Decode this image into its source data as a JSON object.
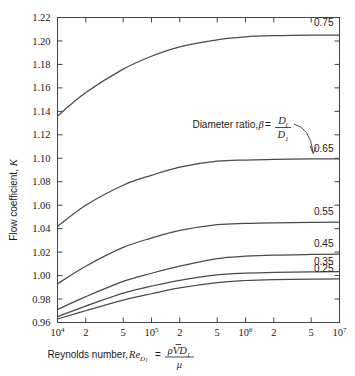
{
  "chart_data": {
    "type": "line",
    "title": "",
    "xlabel": "Reynolds number, Re_D1 = rho V D1 / mu",
    "ylabel": "Flow coefficient, K",
    "xscale": "log",
    "xlim": [
      10000,
      10000000
    ],
    "ylim": [
      0.96,
      1.22
    ],
    "grid": false,
    "legend_position": "inline-right-end-labels",
    "xtick_labels": [
      "10",
      "2",
      "5",
      "10",
      "2",
      "5",
      "10",
      "2",
      "5",
      "10"
    ],
    "xtick_exponents": [
      "4",
      "",
      "",
      "5",
      "",
      "",
      "6",
      "",
      "",
      "7"
    ],
    "xtick_values": [
      10000,
      20000,
      50000,
      100000,
      200000,
      500000,
      1000000,
      2000000,
      5000000,
      10000000
    ],
    "ytick_labels": [
      "1.22",
      "1.20",
      "1.18",
      "1.16",
      "1.14",
      "1.12",
      "1.10",
      "1.08",
      "1.06",
      "1.04",
      "1.02",
      "1.00",
      "0.98",
      "0.96"
    ],
    "ytick_values": [
      1.22,
      1.2,
      1.18,
      1.16,
      1.14,
      1.12,
      1.1,
      1.08,
      1.06,
      1.04,
      1.02,
      1.0,
      0.98,
      0.96
    ],
    "x": [
      10000,
      20000,
      50000,
      100000,
      200000,
      500000,
      1000000,
      2000000,
      5000000,
      10000000
    ],
    "series": [
      {
        "name": "0.75",
        "label": "0.75",
        "values": [
          1.136,
          1.156,
          1.176,
          1.187,
          1.195,
          1.201,
          1.2035,
          1.2045,
          1.205,
          1.205
        ]
      },
      {
        "name": "0.65",
        "label": "0.65",
        "values": [
          1.042,
          1.06,
          1.077,
          1.0855,
          1.0925,
          1.0975,
          1.0985,
          1.099,
          1.0995,
          1.0995
        ]
      },
      {
        "name": "0.55",
        "label": "0.55",
        "values": [
          0.993,
          1.008,
          1.024,
          1.032,
          1.0385,
          1.0435,
          1.0445,
          1.045,
          1.0453,
          1.0455
        ]
      },
      {
        "name": "0.45",
        "label": "0.45",
        "values": [
          0.971,
          0.982,
          0.995,
          1.002,
          1.008,
          1.0145,
          1.0165,
          1.0175,
          1.018,
          1.0182
        ]
      },
      {
        "name": "0.35",
        "label": "0.35",
        "values": [
          0.965,
          0.974,
          0.985,
          0.991,
          0.996,
          1.0005,
          1.002,
          1.0028,
          1.0032,
          1.0034
        ]
      },
      {
        "name": "0.25",
        "label": "0.25",
        "values": [
          0.963,
          0.97,
          0.979,
          0.9845,
          0.9895,
          0.994,
          0.9958,
          0.9966,
          0.997,
          0.9972
        ]
      }
    ],
    "annotation": {
      "prefix": "Diameter ratio, ",
      "beta": "β",
      "equals": " = ",
      "numerator": "D",
      "numerator_sub": "t",
      "denominator": "D",
      "denominator_sub": "1",
      "points_to": "0.65"
    },
    "axis_title_x": {
      "prefix": "Reynolds number, ",
      "re": "Re",
      "re_sub": "D",
      "re_sub_sub": "1",
      "equals": " = ",
      "numerator_rho": "ρ",
      "numerator_v": "V",
      "numerator_d": "D",
      "numerator_d_sub": "1",
      "denominator": "μ"
    },
    "axis_title_y": {
      "text": "Flow coefficient, ",
      "symbol": "K"
    },
    "colors": {
      "curve": "#4a4a4a",
      "frame": "#444444",
      "text": "#1a1a1a",
      "background": "#ffffff"
    }
  }
}
